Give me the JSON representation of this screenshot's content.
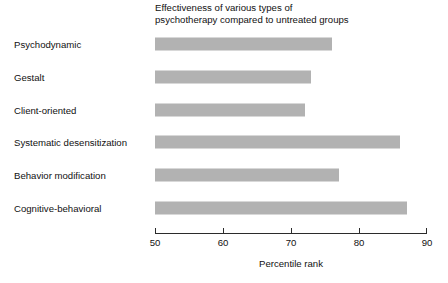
{
  "chart_data": {
    "type": "bar",
    "orientation": "horizontal",
    "title": "Effectiveness of various types of\npsychotherapy compared to untreated groups",
    "title_line1": "Effectiveness of various types of",
    "title_line2": "psychotherapy compared to untreated groups",
    "xlabel": "Percentile rank",
    "ylabel": "",
    "xlim": [
      50,
      90
    ],
    "xticks": [
      50,
      60,
      70,
      80,
      90
    ],
    "xtick_labels": [
      "50",
      "60",
      "70",
      "80",
      "90"
    ],
    "grid": false,
    "legend": false,
    "bar_color": "#b2b2b2",
    "axis_color": "#2b2b2b",
    "text_color": "#111111",
    "categories": [
      "Psychodynamic",
      "Gestalt",
      "Client-oriented",
      "Systematic desensitization",
      "Behavior modification",
      "Cognitive-behavioral"
    ],
    "values": [
      76,
      73,
      72,
      86,
      77,
      87
    ],
    "series": [
      {
        "name": "Percentile rank",
        "values": [
          76,
          73,
          72,
          86,
          77,
          87
        ]
      }
    ]
  }
}
